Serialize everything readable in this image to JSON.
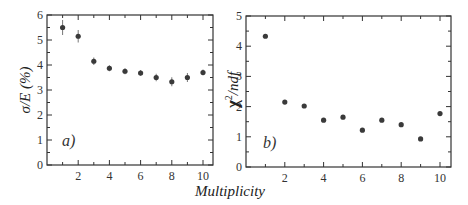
{
  "chart_data": [
    {
      "type": "scatter",
      "panel_label": "a)",
      "title": "",
      "xlabel": "Multiplicity",
      "ylabel": "σ/E (%)",
      "xlim": [
        0,
        10.6
      ],
      "ylim": [
        0,
        6
      ],
      "x_ticks": [
        2,
        4,
        6,
        8,
        10
      ],
      "y_ticks": [
        0,
        1,
        2,
        3,
        4,
        5,
        6
      ],
      "grid": false,
      "error_bars": true,
      "series": [
        {
          "name": "resolution",
          "x": [
            1,
            2,
            3,
            4,
            5,
            6,
            7,
            8,
            9,
            10
          ],
          "values": [
            5.5,
            5.15,
            4.15,
            3.87,
            3.75,
            3.68,
            3.5,
            3.33,
            3.5,
            3.7
          ],
          "errors": [
            0.3,
            0.25,
            0.15,
            0.12,
            0.12,
            0.12,
            0.15,
            0.18,
            0.18,
            0.12
          ]
        }
      ]
    },
    {
      "type": "scatter",
      "panel_label": "b)",
      "title": "",
      "xlabel": "Multiplicity",
      "ylabel": "χ²/ndf",
      "xlim": [
        0,
        10.6
      ],
      "ylim": [
        0,
        5
      ],
      "x_ticks": [
        2,
        4,
        6,
        8,
        10
      ],
      "y_ticks": [
        0,
        1,
        2,
        3,
        4,
        5
      ],
      "grid": false,
      "error_bars": false,
      "series": [
        {
          "name": "chi2_ndf",
          "x": [
            1,
            2,
            3,
            4,
            5,
            6,
            7,
            8,
            9,
            10
          ],
          "values": [
            4.33,
            2.15,
            2.02,
            1.55,
            1.65,
            1.22,
            1.55,
            1.4,
            0.93,
            1.77
          ]
        }
      ]
    }
  ],
  "labels": {
    "shared_xlabel": "Multiplicity",
    "a_ylabel": "σ/E (%)",
    "b_ylabel_main": "χ",
    "b_ylabel_sup": "2",
    "b_ylabel_rest": "/ndf",
    "a_panel": "a)",
    "b_panel": "b)"
  },
  "colors": {
    "axis": "#333333",
    "marker": "#3a3a3a",
    "text": "#333333"
  }
}
